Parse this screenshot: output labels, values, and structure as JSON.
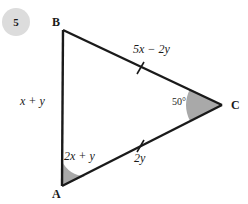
{
  "problem": {
    "number": "5"
  },
  "figure": {
    "type": "triangle",
    "vertices": [
      {
        "name": "B",
        "label": "B",
        "x": 63,
        "y": 30
      },
      {
        "name": "A",
        "label": "A",
        "x": 62,
        "y": 186
      },
      {
        "name": "C",
        "label": "C",
        "x": 222,
        "y": 105
      }
    ],
    "sides": [
      {
        "name": "AB",
        "label": "x + y",
        "tick_marks": 0
      },
      {
        "name": "BC",
        "label": "5x − 2y",
        "tick_marks": 1
      },
      {
        "name": "AC",
        "label": "2y",
        "tick_marks": 1
      }
    ],
    "angles": [
      {
        "vertex": "A",
        "label": "2x + y",
        "shaded": true
      },
      {
        "vertex": "C",
        "label": "50°",
        "shaded": true
      }
    ],
    "colors": {
      "stroke": "#1a1a1a",
      "angle_fill": "#a9a9a9",
      "badge_fill": "#dcdcdc",
      "background": "#ffffff"
    }
  }
}
